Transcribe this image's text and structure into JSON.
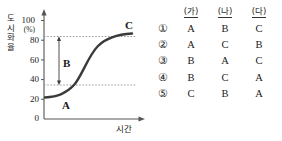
{
  "figure": {
    "y_axis": {
      "label_chars": [
        "도",
        "시",
        "화",
        "율"
      ],
      "unit": "(%)",
      "ticks": [
        "100",
        "80",
        "60",
        "40",
        "20",
        "0"
      ],
      "min": 0,
      "max": 100
    },
    "x_axis": {
      "label": "시간"
    },
    "annotations": {
      "a": "A",
      "b": "B",
      "c": "C"
    },
    "guide_lines": [
      75,
      26
    ],
    "curve_points": [
      [
        0,
        22
      ],
      [
        8,
        22.5
      ],
      [
        16,
        23.5
      ],
      [
        24,
        25
      ],
      [
        32,
        27.5
      ],
      [
        40,
        31
      ],
      [
        48,
        36
      ],
      [
        56,
        43
      ],
      [
        64,
        51
      ],
      [
        72,
        59
      ],
      [
        78,
        65
      ],
      [
        84,
        70
      ],
      [
        90,
        74
      ],
      [
        96,
        77
      ],
      [
        100,
        79
      ]
    ]
  },
  "answers": {
    "headers": [
      "(가)",
      "(나)",
      "(다)"
    ],
    "rows": [
      {
        "num": "①",
        "values": [
          "A",
          "B",
          "C"
        ]
      },
      {
        "num": "②",
        "values": [
          "A",
          "C",
          "B"
        ]
      },
      {
        "num": "③",
        "values": [
          "B",
          "A",
          "C"
        ]
      },
      {
        "num": "④",
        "values": [
          "B",
          "C",
          "A"
        ]
      },
      {
        "num": "⑤",
        "values": [
          "C",
          "B",
          "A"
        ]
      }
    ]
  },
  "colors": {
    "axis": "#555555",
    "curve": "#3a3a3a",
    "guide": "#9a9a9a",
    "text": "#1a1a1a"
  }
}
